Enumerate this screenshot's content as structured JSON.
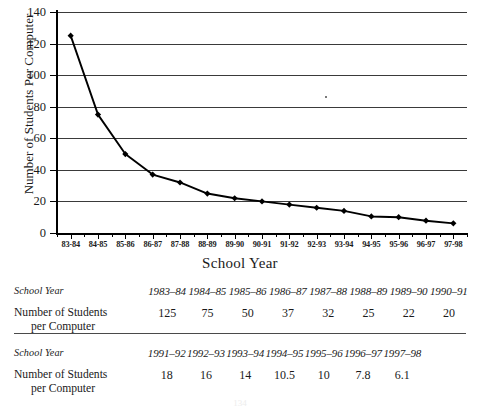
{
  "chart_data": {
    "type": "line",
    "title": "",
    "xlabel": "School Year",
    "ylabel": "Number of Students Per Computer",
    "ylim": [
      0,
      140
    ],
    "ytick_step": 20,
    "grid": true,
    "legend": "none",
    "marker": "filled-diamond",
    "line_color": "#000000",
    "grid_color": "#3a3a3a",
    "categories": [
      "83-84",
      "84-85",
      "85-86",
      "86-87",
      "87-88",
      "88-89",
      "89-90",
      "90-91",
      "91-92",
      "92-93",
      "93-94",
      "94-95",
      "95-96",
      "96-97",
      "97-98"
    ],
    "values": [
      125,
      75,
      50,
      37,
      32,
      25,
      22,
      20,
      18,
      16,
      14,
      10.5,
      10,
      7.8,
      6.1
    ],
    "yticks": [
      "0",
      "20",
      "40",
      "60",
      "80",
      "100",
      "120",
      "140"
    ]
  },
  "axis": {
    "y_title": "Number of Students Per Computer",
    "x_title": "School Year"
  },
  "tables": [
    {
      "row_year_label": "School Year",
      "row_count_label_line1": "Number of Students",
      "row_count_label_line2": "per Computer",
      "years": [
        "1983–84",
        "1984–85",
        "1985–86",
        "1986–87",
        "1987–88",
        "1988–89",
        "1989–90",
        "1990–91"
      ],
      "values": [
        "125",
        "75",
        "50",
        "37",
        "32",
        "25",
        "22",
        "20"
      ]
    },
    {
      "row_year_label": "School Year",
      "row_count_label_line1": "Number of Students",
      "row_count_label_line2": "per Computer",
      "years": [
        "1991–92",
        "1992–93",
        "1993–94",
        "1994–95",
        "1995–96",
        "1996–97",
        "1997–98"
      ],
      "values": [
        "18",
        "16",
        "14",
        "10.5",
        "10",
        "7.8",
        "6.1"
      ]
    }
  ],
  "page_number": "134"
}
